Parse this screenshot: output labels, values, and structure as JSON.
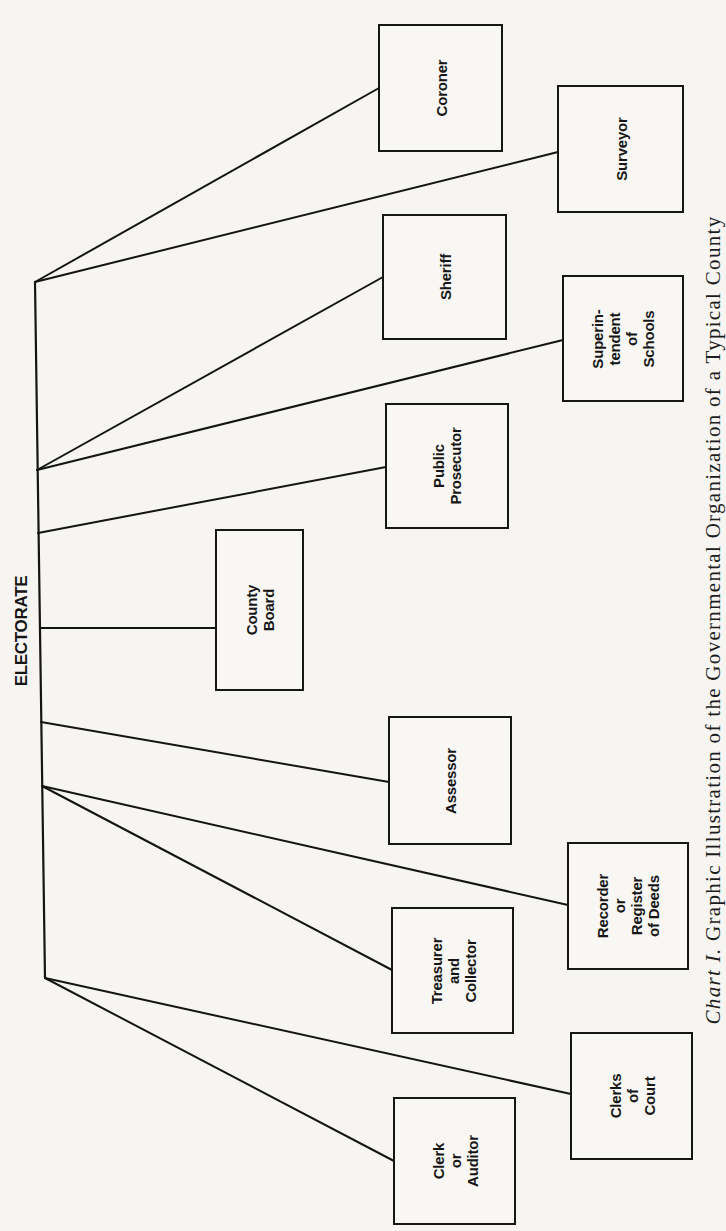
{
  "chart": {
    "root": {
      "label": "ELECTORATE"
    },
    "offices": [
      {
        "id": "coroner",
        "label": "Coroner",
        "box": [
          378,
          24,
          125,
          128
        ]
      },
      {
        "id": "surveyor",
        "label": "Surveyor",
        "box": [
          557,
          85,
          127,
          128
        ]
      },
      {
        "id": "sheriff",
        "label": "Sheriff",
        "box": [
          382,
          214,
          125,
          126
        ]
      },
      {
        "id": "superintendent",
        "label": "Superin-\ntendent\nof Schools",
        "box": [
          562,
          275,
          122,
          127
        ]
      },
      {
        "id": "public-prosecutor",
        "label": "Public\nProsecutor",
        "box": [
          385,
          403,
          124,
          126
        ]
      },
      {
        "id": "county-board",
        "label": "County Board",
        "box": [
          215,
          529,
          89,
          162
        ]
      },
      {
        "id": "assessor",
        "label": "Assessor",
        "box": [
          388,
          716,
          124,
          129
        ]
      },
      {
        "id": "recorder",
        "label": "Recorder or\nRegister\nof Deeds",
        "box": [
          567,
          842,
          122,
          128
        ]
      },
      {
        "id": "treasurer",
        "label": "Treasurer\nand\nCollector",
        "box": [
          391,
          907,
          123,
          127
        ]
      },
      {
        "id": "clerks-of-court",
        "label": "Clerks\nof Court",
        "box": [
          570,
          1032,
          123,
          128
        ]
      },
      {
        "id": "clerk-auditor",
        "label": "Clerk or\nAuditor",
        "box": [
          393,
          1097,
          123,
          128
        ]
      }
    ],
    "trunk": {
      "x1": 35,
      "y1": 282,
      "x2": 45,
      "y2": 978
    },
    "connectors": [
      {
        "to": "coroner",
        "from": [
          35,
          282
        ],
        "end": [
          379,
          88
        ]
      },
      {
        "to": "surveyor",
        "from": [
          35,
          282
        ],
        "end": [
          558,
          152
        ]
      },
      {
        "to": "sheriff",
        "from": [
          37,
          470
        ],
        "end": [
          383,
          277
        ]
      },
      {
        "to": "superintendent",
        "from": [
          37,
          470
        ],
        "end": [
          563,
          340
        ]
      },
      {
        "to": "public-prosecutor",
        "from": [
          38,
          533
        ],
        "end": [
          386,
          467
        ]
      },
      {
        "to": "county-board",
        "from": [
          40,
          628
        ],
        "end": [
          216,
          628
        ]
      },
      {
        "to": "assessor",
        "from": [
          41,
          722
        ],
        "end": [
          389,
          782
        ]
      },
      {
        "to": "recorder",
        "from": [
          42,
          786
        ],
        "end": [
          568,
          905
        ]
      },
      {
        "to": "treasurer",
        "from": [
          42,
          786
        ],
        "end": [
          392,
          970
        ]
      },
      {
        "to": "clerks-of-court",
        "from": [
          45,
          978
        ],
        "end": [
          571,
          1094
        ]
      },
      {
        "to": "clerk-auditor",
        "from": [
          45,
          978
        ],
        "end": [
          394,
          1161
        ]
      }
    ],
    "caption": {
      "prefix": "Chart I.",
      "text": " Graphic Illustration of the Governmental Organization of a Typical County"
    }
  },
  "colors": {
    "paper": "#f6f5f1",
    "ink": "#161616"
  }
}
